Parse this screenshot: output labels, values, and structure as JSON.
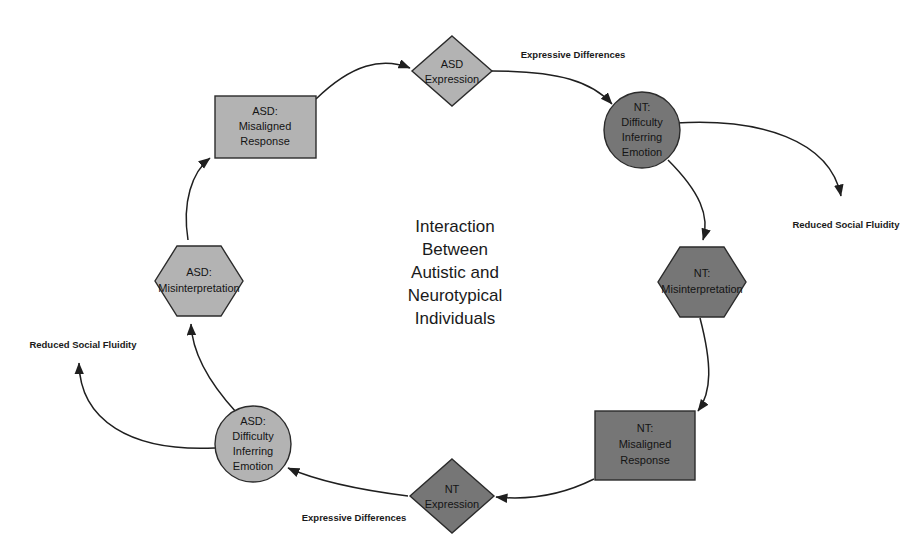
{
  "canvas": {
    "width": 922,
    "height": 547,
    "background": "#ffffff"
  },
  "center_title": {
    "lines": [
      "Interaction",
      "Between",
      "Autistic and",
      "Neurotypical",
      "Individuals"
    ]
  },
  "colors": {
    "light_gray_fill": "#b3b3b3",
    "dark_gray_fill": "#767676",
    "node_stroke": "#2b2b2b",
    "edge_stroke": "#1f1f1f",
    "text": "#141414",
    "background": "#ffffff"
  },
  "nodes": {
    "asd_expression": {
      "label_lines": [
        "ASD",
        "Expression"
      ],
      "shape": "diamond",
      "fill": "#b3b3b3",
      "cx": 452,
      "cy": 71
    },
    "nt_difficulty": {
      "label_lines": [
        "NT:",
        "Difficulty",
        "Inferring",
        "Emotion"
      ],
      "shape": "circle",
      "fill": "#767676",
      "cx": 642,
      "cy": 130
    },
    "nt_misinterpretation": {
      "label_lines": [
        "NT:",
        "Misinterpretation"
      ],
      "shape": "hexagon",
      "fill": "#767676",
      "cx": 702,
      "cy": 282
    },
    "nt_misaligned_response": {
      "label_lines": [
        "NT:",
        "Misaligned",
        "Response"
      ],
      "shape": "rect",
      "fill": "#767676",
      "cx": 645,
      "cy": 445
    },
    "nt_expression": {
      "label_lines": [
        "NT",
        "Expression"
      ],
      "shape": "diamond",
      "fill": "#767676",
      "cx": 452,
      "cy": 496
    },
    "asd_difficulty": {
      "label_lines": [
        "ASD:",
        "Difficulty",
        "Inferring",
        "Emotion"
      ],
      "shape": "circle",
      "fill": "#b3b3b3",
      "cx": 253,
      "cy": 444
    },
    "asd_misinterpretation": {
      "label_lines": [
        "ASD:",
        "Misinterpretation"
      ],
      "shape": "hexagon",
      "fill": "#b3b3b3",
      "cx": 199,
      "cy": 281
    },
    "asd_misaligned_response": {
      "label_lines": [
        "ASD:",
        "Misaligned",
        "Response"
      ],
      "shape": "rect",
      "fill": "#b3b3b3",
      "cx": 265,
      "cy": 127
    }
  },
  "edge_labels": {
    "top_expressive_differences": "Expressive Differences",
    "bottom_expressive_differences": "Expressive Differences",
    "right_reduced_social_fluidity": "Reduced Social Fluidity",
    "left_reduced_social_fluidity": "Reduced Social Fluidity"
  }
}
